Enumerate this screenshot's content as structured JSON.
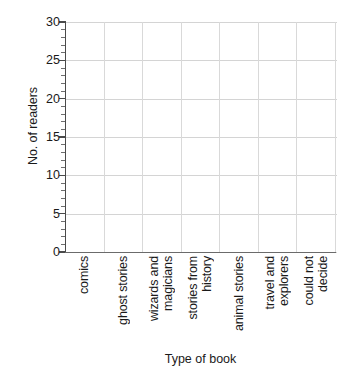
{
  "chart_data": {
    "type": "bar",
    "title": "",
    "xlabel": "Type of book",
    "ylabel": "No. of readers",
    "categories": [
      "comics",
      "ghost stories",
      "wizards and magicians",
      "stories from history",
      "animal stories",
      "travel and explorers",
      "could not decide"
    ],
    "category_lines": [
      [
        "comics"
      ],
      [
        "ghost stories"
      ],
      [
        "wizards and",
        "magicians"
      ],
      [
        "stories from",
        "history"
      ],
      [
        "animal stories"
      ],
      [
        "travel and",
        "explorers"
      ],
      [
        "could not",
        "decide"
      ]
    ],
    "values": [
      null,
      null,
      null,
      null,
      null,
      null,
      null
    ],
    "ylim": [
      0,
      30
    ],
    "y_major_ticks": [
      0,
      5,
      10,
      15,
      20,
      25,
      30
    ],
    "y_tick_labels": [
      "0",
      "5",
      "10",
      "15",
      "20",
      "25",
      "30"
    ],
    "y_minor_tick_interval": 1,
    "grid": "both",
    "legend": "none",
    "note": "Empty axes template: no bars or data plotted."
  },
  "axis": {
    "y_title": "No. of readers",
    "x_title": "Type of book"
  },
  "colors": {
    "background": "#ffffff",
    "gridline": "#d6d6d6",
    "axis": "#4a4a4a",
    "text": "#1a1a1a"
  }
}
